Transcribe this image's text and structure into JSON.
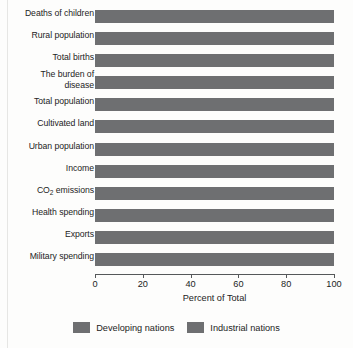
{
  "chart_data": {
    "type": "bar",
    "orientation": "horizontal",
    "stacked": true,
    "normalized_percent": true,
    "title": "",
    "xlabel": "Percent of Total",
    "ylabel": "",
    "xlim": [
      0,
      100
    ],
    "xticks": [
      0,
      20,
      40,
      60,
      80,
      100
    ],
    "xtick_labels": [
      "0",
      "20",
      "40",
      "60",
      "80",
      "100"
    ],
    "grid": false,
    "legend_position": "bottom-center",
    "categories": [
      "Deaths of children",
      "Rural population",
      "Total births",
      "The burden of disease",
      "Total population",
      "Cultivated land",
      "Urban population",
      "Income",
      "CO2 emissions",
      "Health spending",
      "Exports",
      "Military spending"
    ],
    "series": [
      {
        "name": "Developing nations",
        "color": "#6e6f71",
        "values": [
          100,
          100,
          100,
          100,
          100,
          100,
          100,
          100,
          100,
          100,
          100,
          100
        ]
      },
      {
        "name": "Industrial nations",
        "color": "#6e6f71",
        "values": [
          0,
          0,
          0,
          0,
          0,
          0,
          0,
          0,
          0,
          0,
          0,
          0
        ]
      }
    ]
  },
  "axis": {
    "title": "Percent of Total",
    "ticks": [
      "0",
      "20",
      "40",
      "60",
      "80",
      "100"
    ]
  },
  "categories": [
    {
      "label": "Deaths of children",
      "two_line": false
    },
    {
      "label": "Rural population",
      "two_line": false
    },
    {
      "label": "Total births",
      "two_line": false
    },
    {
      "label": "The burden of disease",
      "two_line": true,
      "line1": "The burden of",
      "line2": "disease"
    },
    {
      "label": "Total population",
      "two_line": false
    },
    {
      "label": "Cultivated land",
      "two_line": false
    },
    {
      "label": "Urban population",
      "two_line": false
    },
    {
      "label": "Income",
      "two_line": false
    },
    {
      "label": "CO2 emissions",
      "two_line": false,
      "has_subscript": true,
      "sub_pre": "CO",
      "sub_char": "2",
      "sub_post": " emissions"
    },
    {
      "label": "Health spending",
      "two_line": false
    },
    {
      "label": "Exports",
      "two_line": false
    },
    {
      "label": "Military spending",
      "two_line": false
    }
  ],
  "legend": {
    "items": [
      {
        "label": "Developing nations",
        "color": "#6e6f71"
      },
      {
        "label": "Industrial nations",
        "color": "#6e6f71"
      }
    ]
  },
  "colors": {
    "developing": "#6e6f71",
    "industrial": "#6e6f71",
    "axis": "#55585a",
    "text": "#232323",
    "background": "#fdfdfc"
  }
}
